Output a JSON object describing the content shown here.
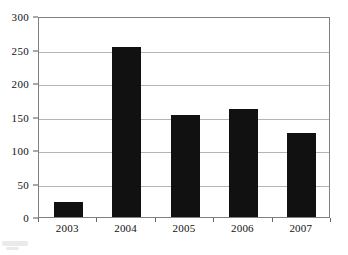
{
  "chart_data": {
    "type": "bar",
    "title": "",
    "subtitle": "",
    "xlabel": "",
    "ylabel": "",
    "categories": [
      "2003",
      "2004",
      "2005",
      "2006",
      "2007"
    ],
    "values": [
      22,
      254,
      153,
      161,
      125
    ],
    "series": [
      {
        "name": "",
        "values": [
          22,
          254,
          153,
          161,
          125
        ]
      }
    ],
    "ylim": [
      0,
      300
    ],
    "y_ticks": [
      0,
      50,
      100,
      150,
      200,
      250,
      300
    ],
    "y_tick_labels": [
      "0",
      "50",
      "100",
      "150",
      "200",
      "250",
      "300"
    ],
    "grid": "horizontal",
    "legend": "none",
    "bar_color": "#111111",
    "gridline_color": "#b4b4b4",
    "axis_color": "#808080",
    "background_color": "#ffffff"
  },
  "figure": {
    "name": "bar-chart"
  }
}
